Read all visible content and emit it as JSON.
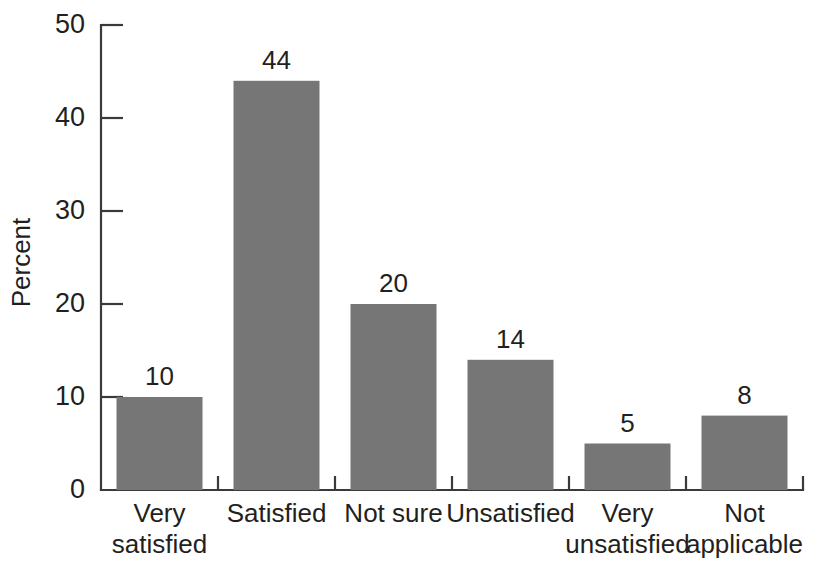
{
  "chart_data": {
    "type": "bar",
    "title": "",
    "subtitle": "",
    "xlabel": "",
    "ylabel": "Percent",
    "ylim": [
      0,
      50
    ],
    "yticks": [
      0,
      10,
      20,
      30,
      40,
      50
    ],
    "ytick_labels": [
      "0",
      "10",
      "20",
      "30",
      "40",
      "50"
    ],
    "grid": false,
    "legend": false,
    "legend_position": "none",
    "orientation": "vertical",
    "bar_color": "#767676",
    "axis_color": "#3a3a3a",
    "background_color": "#ffffff",
    "categories": [
      "Very satisfied",
      "Satisfied",
      "Not sure",
      "Unsatisfied",
      "Very unsatisfied",
      "Not applicable"
    ],
    "category_lines": [
      [
        "Very",
        "satisfied"
      ],
      [
        "Satisfied"
      ],
      [
        "Not sure"
      ],
      [
        "Unsatisfied"
      ],
      [
        "Very",
        "unsatisfied"
      ],
      [
        "Not",
        "applicable"
      ]
    ],
    "values": [
      10,
      44,
      20,
      14,
      5,
      8
    ],
    "value_labels": [
      "10",
      "44",
      "20",
      "14",
      "5",
      "8"
    ]
  }
}
